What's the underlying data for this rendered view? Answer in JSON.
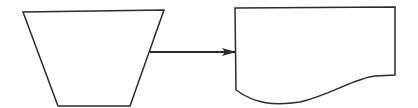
{
  "diagram": {
    "type": "flowchart",
    "stroke_color": "#2a2a2a",
    "background": "#ffffff",
    "nodes": [
      {
        "id": "manual-operation",
        "shape": "trapezoid",
        "label": ""
      },
      {
        "id": "document",
        "shape": "document",
        "label": ""
      }
    ],
    "edges": [
      {
        "from": "manual-operation",
        "to": "document",
        "style": "arrow"
      }
    ]
  }
}
